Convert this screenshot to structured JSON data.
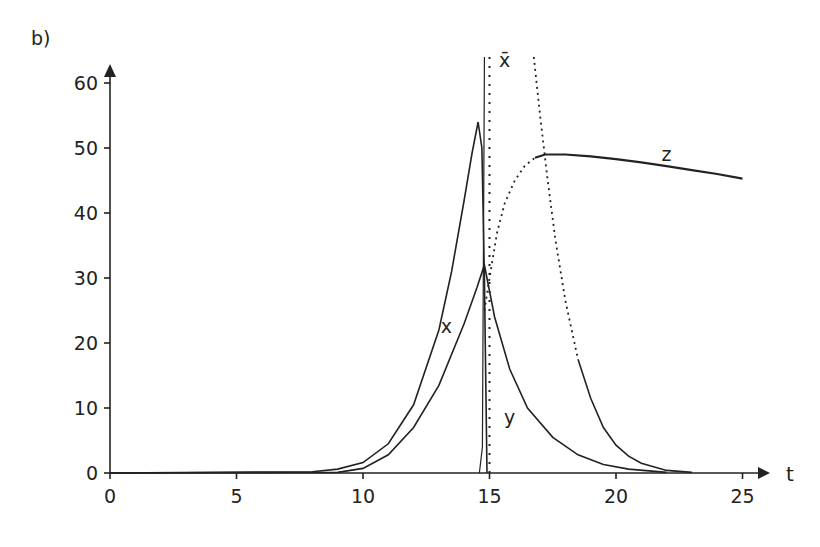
{
  "panel_label": "b)",
  "chart_data": {
    "type": "line",
    "title": "",
    "xlabel": "t",
    "ylabel": "",
    "xlim": [
      0,
      26
    ],
    "ylim": [
      0,
      64
    ],
    "x_ticks": [
      0,
      5,
      10,
      15,
      20,
      25
    ],
    "y_ticks": [
      0,
      10,
      20,
      30,
      40,
      50,
      60
    ],
    "grid": false,
    "legend": "inline labels",
    "annotations": [
      {
        "text": "x",
        "t": 13.3,
        "y": 21.5
      },
      {
        "text": "y",
        "t": 15.8,
        "y": 7.5
      },
      {
        "text": "z",
        "t": 22.0,
        "y": 48.0
      },
      {
        "text": "x̄",
        "t": 15.6,
        "y": 62.5
      }
    ],
    "series": [
      {
        "name": "x",
        "style": "solid",
        "t": [
          0,
          8,
          9,
          10,
          11,
          12,
          13,
          13.5,
          14,
          14.3,
          14.55,
          14.7,
          14.8,
          14.9
        ],
        "values": [
          0,
          0.2,
          0.6,
          1.6,
          4.5,
          10.5,
          22,
          31,
          42,
          49,
          54,
          50,
          30,
          0
        ]
      },
      {
        "name": "y",
        "style": "solid",
        "t": [
          0,
          9,
          10,
          11,
          12,
          13,
          14,
          14.5,
          14.8,
          15.2,
          15.8,
          16.5,
          17.5,
          18.5,
          19.5,
          20.5,
          22
        ],
        "values": [
          0,
          0.1,
          0.7,
          2.8,
          7,
          13.5,
          23,
          28.5,
          32,
          24,
          16,
          10,
          5.5,
          2.8,
          1.3,
          0.6,
          0.1
        ]
      },
      {
        "name": "z",
        "style": "dotted-then-solid",
        "t": [
          14.8,
          15.0,
          15.3,
          15.6,
          16.0,
          16.4,
          16.8,
          17.2,
          18,
          19,
          20,
          21,
          22,
          23,
          24,
          25
        ],
        "values": [
          25,
          30,
          37,
          41.5,
          45,
          47.3,
          48.5,
          49,
          49,
          48.7,
          48.3,
          47.8,
          47.2,
          46.6,
          46,
          45.3
        ]
      },
      {
        "name": "x̄",
        "style": "dotted",
        "t": [
          15.0,
          15.0
        ],
        "values": [
          0,
          64
        ]
      },
      {
        "name": "decay",
        "style": "dotted-then-solid",
        "t": [
          16.75,
          17.0,
          17.3,
          17.6,
          18.0,
          18.5,
          19.0,
          19.5,
          20.0,
          20.5,
          21.0,
          22.0,
          23.0
        ],
        "values": [
          64,
          55,
          45,
          36,
          26.5,
          17.5,
          11.5,
          7,
          4.3,
          2.6,
          1.5,
          0.4,
          0.1
        ]
      }
    ]
  }
}
